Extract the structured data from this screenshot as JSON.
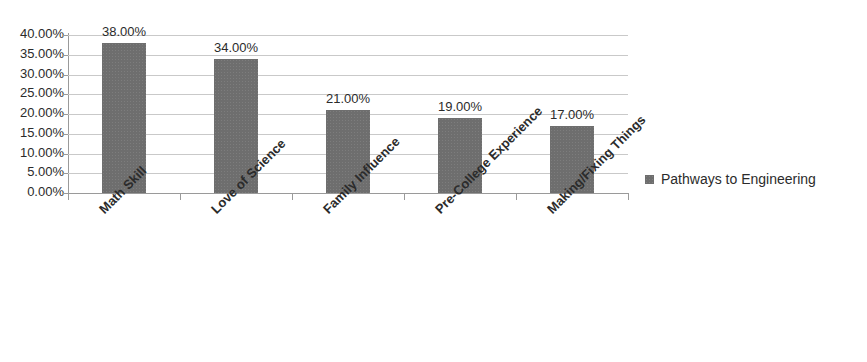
{
  "chart_data": {
    "type": "bar",
    "title": "",
    "categories": [
      "Math Skill",
      "Love of Science",
      "Family Influence",
      "Pre-College Experience",
      "Making/Fixing Things"
    ],
    "values": [
      38,
      34,
      21,
      19,
      17
    ],
    "value_labels": [
      "38.00%",
      "34.00%",
      "21.00%",
      "19.00%",
      "17.00%"
    ],
    "series": [
      {
        "name": "Pathways to Engineering",
        "values": [
          38,
          34,
          21,
          19,
          17
        ],
        "color": "#6e6e6e"
      }
    ],
    "xlabel": "",
    "ylabel": "",
    "ylim": [
      0,
      40
    ],
    "ytick_values": [
      40,
      35,
      30,
      25,
      20,
      15,
      10,
      5,
      0
    ],
    "ytick_labels": [
      "40.00%",
      "35.00%",
      "30.00%",
      "25.00%",
      "20.00%",
      "15.00%",
      "10.00%",
      "5.00%",
      "0.00%"
    ],
    "grid": true,
    "legend_position": "right"
  },
  "legend": {
    "entries": [
      {
        "label": "Pathways to Engineering",
        "color": "#6e6e6e"
      }
    ]
  },
  "colors": {
    "bar": "#6e6e6e",
    "gridline": "#c9c9c9",
    "axis": "#9a9a9a",
    "text": "#2b2b2b",
    "background": "#ffffff"
  }
}
